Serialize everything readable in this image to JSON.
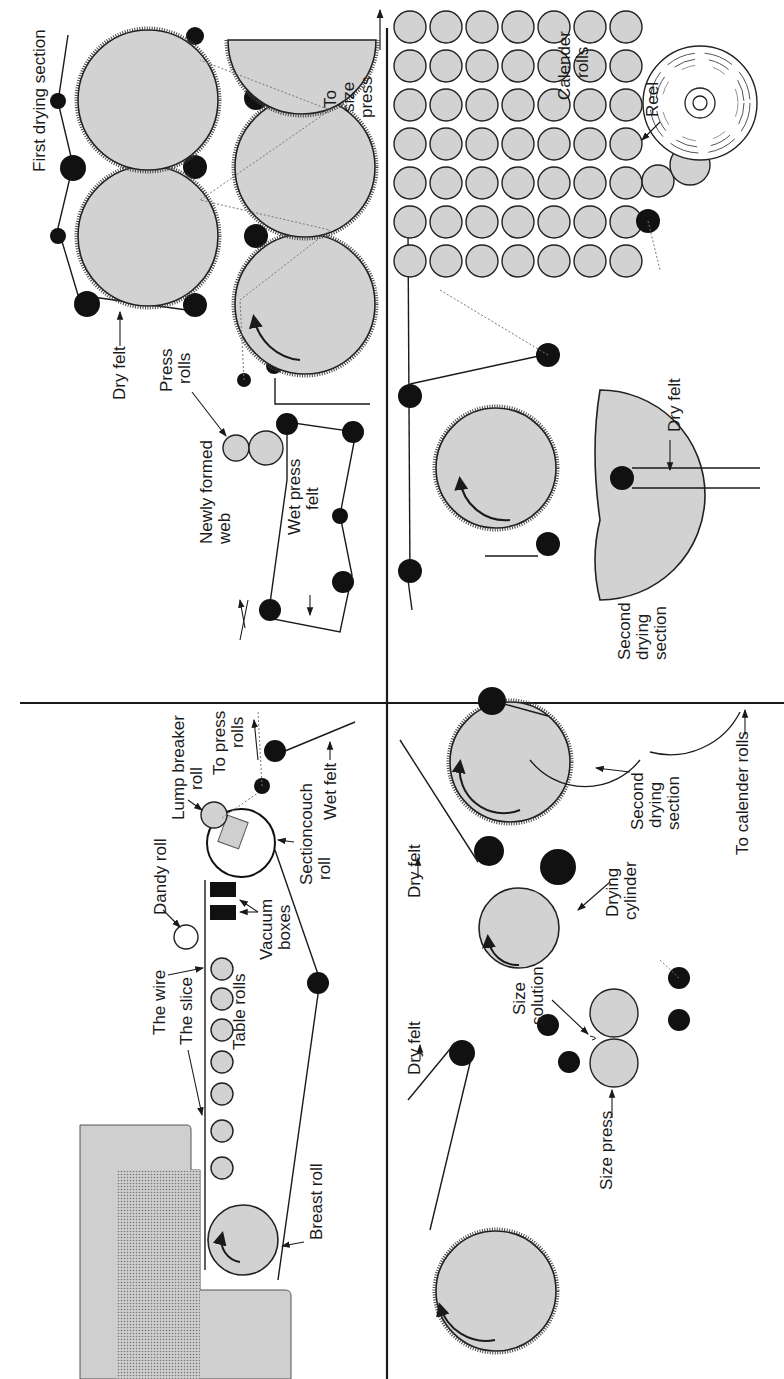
{
  "figure": {
    "orientation": "rotated 90 degrees clockwise",
    "divider_color": "#1a1a1a",
    "cylinder_fill": "#d2d2d2",
    "roll_fill": "#111111"
  },
  "quadrants": {
    "wet_end": {
      "labels": {
        "the_slice": "The slice",
        "the_wire": "The wire",
        "table_rolls": "Table rolls",
        "dandy_roll": "Dandy roll",
        "vacuum_boxes_1": "Vacuum",
        "vacuum_boxes_2": "boxes",
        "lump_breaker_1": "Lump breaker",
        "lump_breaker_2": "roll",
        "section_couch_1": "Sectioncouch",
        "section_couch_2": "roll",
        "to_press_1": "To press",
        "to_press_2": "rolls",
        "wet_felt": "Wet felt",
        "breast_roll": "Breast roll"
      }
    },
    "press_and_first_dryer": {
      "labels": {
        "first_drying_section": "First drying section",
        "dry_felt": "Dry felt",
        "press_rolls_1": "Press",
        "press_rolls_2": "rolls",
        "newly_formed_1": "Newly formed",
        "newly_formed_2": "web",
        "wet_press_felt_1": "Wet press",
        "wet_press_felt_2": "felt",
        "to_size_1": "To",
        "to_size_2": "size",
        "to_size_3": "press"
      }
    },
    "size_press": {
      "labels": {
        "dry_felt_a": "Dry felt",
        "dry_felt_b": "Dry felt",
        "size_solution_1": "Size",
        "size_solution_2": "solution",
        "size_press": "Size press",
        "drying_cylinder_1": "Drying",
        "drying_cylinder_2": "cylinder",
        "second_drying_1": "Second",
        "second_drying_2": "drying",
        "second_drying_3": "section",
        "to_calender": "To calender rolls"
      }
    },
    "dry_end": {
      "labels": {
        "calender_1": "Calender",
        "calender_2": "rolls",
        "reel": "Reel",
        "dry_felt": "Dry felt",
        "second_drying_1": "Second",
        "second_drying_2": "drying",
        "second_drying_3": "section"
      }
    }
  }
}
